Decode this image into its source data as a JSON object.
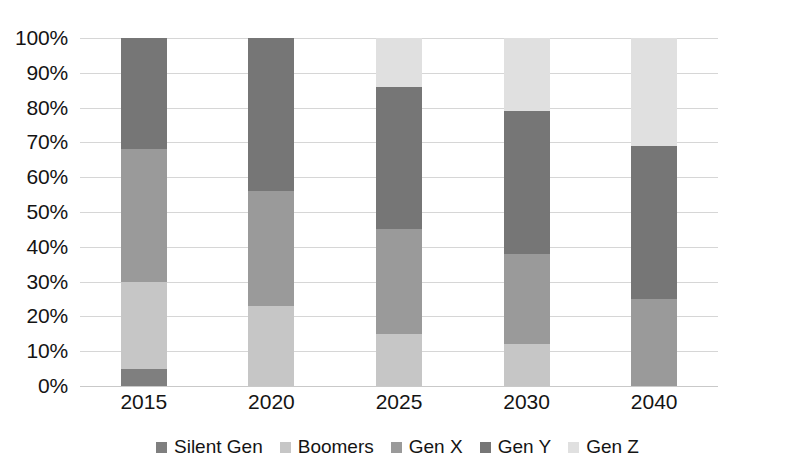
{
  "chart_data": {
    "type": "bar",
    "subtype": "stacked-100-percent",
    "title": "",
    "xlabel": "",
    "ylabel": "",
    "ylim": [
      0,
      100
    ],
    "y_unit": "%",
    "grid": true,
    "legend_position": "bottom",
    "categories": [
      "2015",
      "2020",
      "2025",
      "2030",
      "2040"
    ],
    "y_ticks": [
      "0%",
      "10%",
      "20%",
      "30%",
      "40%",
      "50%",
      "60%",
      "70%",
      "80%",
      "90%",
      "100%"
    ],
    "y_tick_values": [
      0,
      10,
      20,
      30,
      40,
      50,
      60,
      70,
      80,
      90,
      100
    ],
    "series": [
      {
        "name": "Silent Gen",
        "color": "#7f7f7f",
        "values": [
          5,
          0,
          0,
          0,
          0
        ]
      },
      {
        "name": "Boomers",
        "color": "#c6c6c6",
        "values": [
          25,
          23,
          15,
          12,
          0
        ]
      },
      {
        "name": "Gen X",
        "color": "#9a9a9a",
        "values": [
          38,
          33,
          30,
          26,
          25
        ]
      },
      {
        "name": "Gen Y",
        "color": "#767676",
        "values": [
          32,
          44,
          41,
          41,
          44
        ]
      },
      {
        "name": "Gen Z",
        "color": "#e0e0e0",
        "values": [
          0,
          0,
          14,
          21,
          31
        ]
      }
    ],
    "stack_boundaries": {
      "2015": [
        0,
        5,
        30,
        68,
        100,
        100
      ],
      "2020": [
        0,
        0,
        23,
        56,
        100,
        100
      ],
      "2025": [
        0,
        0,
        15,
        45,
        86,
        100
      ],
      "2030": [
        0,
        0,
        12,
        38,
        79,
        100
      ],
      "2040": [
        0,
        0,
        0,
        25,
        69,
        100
      ]
    }
  },
  "legend": {
    "items": [
      {
        "label": "Silent Gen"
      },
      {
        "label": "Boomers"
      },
      {
        "label": "Gen X"
      },
      {
        "label": "Gen Y"
      },
      {
        "label": "Gen Z"
      }
    ]
  }
}
